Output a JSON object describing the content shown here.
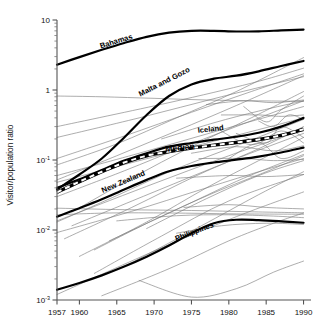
{
  "chart_data": {
    "type": "line",
    "title": "",
    "xlabel": "",
    "ylabel": "Visitor/population ratio",
    "xlim": [
      1957,
      1991
    ],
    "ylim": [
      0.001,
      10
    ],
    "yscale": "log",
    "grid": false,
    "legend": "none",
    "xticks": [
      "1957",
      "1960",
      "1965",
      "1970",
      "1975",
      "1980",
      "1985",
      "1990"
    ],
    "xtick_values": [
      1957,
      1960,
      1965,
      1970,
      1975,
      1980,
      1985,
      1990
    ],
    "yticks": [
      "10",
      "1",
      "10",
      "10",
      "10"
    ],
    "ytick_exponents": [
      "",
      "",
      "-1",
      "-2",
      "-3"
    ],
    "ytick_values": [
      10,
      1,
      0.1,
      0.01,
      0.001
    ],
    "annotations": [
      {
        "text": "Bahamas",
        "x": 1965.0,
        "y": 4.6,
        "rotation": -17
      },
      {
        "text": "Malta and Gozo",
        "x": 1971.5,
        "y": 1.22,
        "rotation": -27
      },
      {
        "text": "Iceland",
        "x": 1977.6,
        "y": 0.255,
        "rotation": -6
      },
      {
        "text": "Median",
        "x": 1973.5,
        "y": 0.137,
        "rotation": -6
      },
      {
        "text": "New Zealand",
        "x": 1966.0,
        "y": 0.0455,
        "rotation": -23
      },
      {
        "text": "Philippines",
        "x": 1975.5,
        "y": 0.0088,
        "rotation": -21
      }
    ],
    "series": [
      {
        "name": "Bahamas",
        "style": "highlight",
        "x": [
          1957,
          1960,
          1963,
          1966,
          1969,
          1972,
          1975,
          1978,
          1981,
          1984,
          1987,
          1990
        ],
        "values": [
          2.3,
          2.95,
          3.75,
          4.7,
          5.75,
          6.6,
          7.0,
          7.0,
          6.85,
          6.9,
          7.1,
          7.3
        ]
      },
      {
        "name": "Malta and Gozo",
        "style": "highlight",
        "x": [
          1957,
          1960,
          1963,
          1966,
          1969,
          1972,
          1975,
          1978,
          1981,
          1984,
          1987,
          1990
        ],
        "values": [
          0.038,
          0.062,
          0.105,
          0.21,
          0.44,
          0.82,
          1.2,
          1.45,
          1.6,
          1.85,
          2.2,
          2.6
        ]
      },
      {
        "name": "Iceland",
        "style": "highlight",
        "x": [
          1957,
          1960,
          1963,
          1966,
          1969,
          1972,
          1975,
          1978,
          1981,
          1984,
          1987,
          1990
        ],
        "values": [
          0.04,
          0.053,
          0.072,
          0.098,
          0.125,
          0.155,
          0.175,
          0.195,
          0.215,
          0.245,
          0.3,
          0.4
        ]
      },
      {
        "name": "Median",
        "style": "median",
        "x": [
          1957,
          1960,
          1963,
          1966,
          1969,
          1972,
          1975,
          1978,
          1981,
          1984,
          1987,
          1990
        ],
        "values": [
          0.0345,
          0.049,
          0.068,
          0.092,
          0.115,
          0.132,
          0.148,
          0.163,
          0.178,
          0.196,
          0.225,
          0.275
        ]
      },
      {
        "name": "New Zealand",
        "style": "highlight",
        "x": [
          1957,
          1960,
          1963,
          1966,
          1969,
          1972,
          1975,
          1978,
          1981,
          1984,
          1987,
          1990
        ],
        "values": [
          0.0155,
          0.0205,
          0.0275,
          0.038,
          0.052,
          0.069,
          0.082,
          0.092,
          0.101,
          0.112,
          0.128,
          0.15
        ]
      },
      {
        "name": "Philippines",
        "style": "highlight",
        "x": [
          1957,
          1960,
          1963,
          1966,
          1969,
          1972,
          1975,
          1978,
          1981,
          1984,
          1987,
          1990
        ],
        "values": [
          0.0014,
          0.00175,
          0.00225,
          0.003,
          0.00415,
          0.006,
          0.009,
          0.0125,
          0.014,
          0.0138,
          0.0133,
          0.0127
        ]
      },
      {
        "name": "bg-01",
        "style": "background",
        "x": [
          1957,
          1963,
          1970,
          1977,
          1984,
          1990
        ],
        "values": [
          0.82,
          0.8,
          0.76,
          0.72,
          0.7,
          0.69
        ]
      },
      {
        "name": "bg-02",
        "style": "background",
        "x": [
          1957,
          1965,
          1973,
          1981,
          1990
        ],
        "values": [
          0.085,
          0.17,
          0.4,
          0.95,
          2.9
        ]
      },
      {
        "name": "bg-03",
        "style": "background",
        "x": [
          1957,
          1965,
          1973,
          1981,
          1990
        ],
        "values": [
          0.052,
          0.115,
          0.26,
          0.6,
          1.6
        ]
      },
      {
        "name": "bg-04",
        "style": "background",
        "x": [
          1957,
          1966,
          1975,
          1983,
          1990
        ],
        "values": [
          0.105,
          0.22,
          0.48,
          0.95,
          1.7
        ]
      },
      {
        "name": "bg-05",
        "style": "background",
        "x": [
          1959,
          1967,
          1975,
          1983,
          1990
        ],
        "values": [
          0.018,
          0.055,
          0.155,
          0.4,
          0.95
        ]
      },
      {
        "name": "bg-06",
        "style": "background",
        "x": [
          1957,
          1966,
          1974,
          1982,
          1990
        ],
        "values": [
          0.03,
          0.07,
          0.155,
          0.33,
          0.7
        ]
      },
      {
        "name": "bg-07",
        "style": "background",
        "x": [
          1957,
          1965,
          1973,
          1982,
          1990
        ],
        "values": [
          0.013,
          0.031,
          0.075,
          0.175,
          0.38
        ]
      },
      {
        "name": "bg-08",
        "style": "background",
        "x": [
          1958,
          1967,
          1976,
          1984,
          1990
        ],
        "values": [
          0.0075,
          0.021,
          0.062,
          0.145,
          0.3
        ]
      },
      {
        "name": "bg-09",
        "style": "background",
        "x": [
          1960,
          1969,
          1977,
          1984,
          1990
        ],
        "values": [
          0.0042,
          0.013,
          0.04,
          0.098,
          0.21
        ]
      },
      {
        "name": "bg-10",
        "style": "background",
        "x": [
          1957,
          1966,
          1975,
          1983,
          1990
        ],
        "values": [
          0.0205,
          0.0195,
          0.019,
          0.0182,
          0.0176
        ]
      },
      {
        "name": "bg-11",
        "style": "background",
        "x": [
          1962,
          1970,
          1978,
          1985,
          1990
        ],
        "values": [
          0.0052,
          0.014,
          0.034,
          0.068,
          0.115
        ]
      },
      {
        "name": "bg-12",
        "style": "background",
        "x": [
          1957,
          1967,
          1976,
          1984,
          1990
        ],
        "values": [
          0.0092,
          0.0185,
          0.037,
          0.068,
          0.105
        ]
      },
      {
        "name": "bg-13",
        "style": "background",
        "x": [
          1965,
          1973,
          1980,
          1986,
          1990
        ],
        "values": [
          0.0135,
          0.016,
          0.0165,
          0.0158,
          0.015
        ]
      },
      {
        "name": "bg-14",
        "style": "background",
        "x": [
          1968,
          1975,
          1981,
          1986,
          1990
        ],
        "values": [
          0.0019,
          0.0011,
          0.00145,
          0.0025,
          0.0036
        ]
      },
      {
        "name": "bg-15",
        "style": "background",
        "x": [
          1963,
          1972,
          1980,
          1986,
          1990
        ],
        "values": [
          0.00115,
          0.0028,
          0.007,
          0.0125,
          0.0175
        ]
      },
      {
        "name": "bg-16",
        "style": "background",
        "x": [
          1971,
          1978,
          1984,
          1990
        ],
        "values": [
          0.2,
          0.34,
          0.5,
          0.7
        ]
      },
      {
        "name": "bg-17",
        "style": "background",
        "x": [
          1973,
          1980,
          1985,
          1990
        ],
        "values": [
          0.055,
          0.06,
          0.058,
          0.062
        ]
      },
      {
        "name": "bg-18",
        "style": "background",
        "x": [
          1974,
          1980,
          1985,
          1990
        ],
        "values": [
          0.021,
          0.023,
          0.021,
          0.02
        ]
      },
      {
        "name": "bg-19",
        "style": "background",
        "x": [
          1976,
          1982,
          1986,
          1990
        ],
        "values": [
          0.105,
          0.105,
          0.098,
          0.102
        ]
      },
      {
        "name": "bg-20",
        "style": "background",
        "x": [
          1978,
          1983,
          1987,
          1990
        ],
        "values": [
          0.3,
          0.165,
          0.26,
          0.175
        ]
      },
      {
        "name": "bg-21",
        "style": "background",
        "x": [
          1979,
          1984,
          1987,
          1990
        ],
        "values": [
          0.44,
          0.44,
          0.42,
          0.44
        ]
      },
      {
        "name": "bg-22",
        "style": "background",
        "x": [
          1980,
          1984,
          1987,
          1990
        ],
        "values": [
          0.105,
          0.175,
          0.105,
          0.135
        ]
      },
      {
        "name": "bg-23",
        "style": "background",
        "x": [
          1957,
          1968,
          1979,
          1990
        ],
        "values": [
          0.21,
          0.4,
          0.8,
          1.55
        ]
      },
      {
        "name": "bg-24",
        "style": "background",
        "x": [
          1957,
          1968,
          1979,
          1990
        ],
        "values": [
          0.06,
          0.125,
          0.27,
          0.58
        ]
      },
      {
        "name": "bg-25",
        "style": "background",
        "x": [
          1959,
          1970,
          1980,
          1990
        ],
        "values": [
          0.0115,
          0.035,
          0.095,
          0.24
        ]
      },
      {
        "name": "bg-26",
        "style": "background",
        "x": [
          1964,
          1974,
          1982,
          1990
        ],
        "values": [
          0.007,
          0.022,
          0.055,
          0.12
        ]
      },
      {
        "name": "bg-27",
        "style": "background",
        "x": [
          1957,
          1969,
          1980,
          1990
        ],
        "values": [
          0.0135,
          0.042,
          0.115,
          0.27
        ]
      },
      {
        "name": "bg-28",
        "style": "background",
        "x": [
          1969,
          1977,
          1984,
          1990
        ],
        "values": [
          0.0105,
          0.028,
          0.06,
          0.098
        ]
      },
      {
        "name": "bg-29",
        "style": "background",
        "x": [
          1957,
          1970,
          1981,
          1990
        ],
        "values": [
          0.0012,
          0.005,
          0.0155,
          0.035
        ]
      },
      {
        "name": "bg-30",
        "style": "background",
        "x": [
          1975,
          1981,
          1986,
          1990
        ],
        "values": [
          0.125,
          0.155,
          0.135,
          0.16
        ]
      },
      {
        "name": "bg-31",
        "style": "background",
        "x": [
          1977,
          1982,
          1986,
          1990
        ],
        "values": [
          0.62,
          0.7,
          0.66,
          0.72
        ]
      },
      {
        "name": "bg-32",
        "style": "background",
        "x": [
          1982,
          1985,
          1987,
          1990
        ],
        "values": [
          0.58,
          0.35,
          0.52,
          0.82
        ]
      },
      {
        "name": "bg-33",
        "style": "background",
        "x": [
          1957,
          1972,
          1983,
          1990
        ],
        "values": [
          0.3,
          0.66,
          1.25,
          2.05
        ]
      },
      {
        "name": "bg-34",
        "style": "background",
        "x": [
          1966,
          1976,
          1984,
          1990
        ],
        "values": [
          0.003,
          0.011,
          0.032,
          0.068
        ]
      },
      {
        "name": "bg-35",
        "style": "background",
        "x": [
          1981,
          1985,
          1987,
          1990
        ],
        "values": [
          0.24,
          0.175,
          0.3,
          0.21
        ]
      },
      {
        "name": "bg-36",
        "style": "background",
        "x": [
          1984,
          1986,
          1988,
          1990
        ],
        "values": [
          0.36,
          0.3,
          0.44,
          0.38
        ]
      },
      {
        "name": "bg-37",
        "style": "background",
        "x": [
          1973,
          1979,
          1985,
          1990
        ],
        "values": [
          0.009,
          0.0115,
          0.0125,
          0.012
        ]
      },
      {
        "name": "bg-38",
        "style": "background",
        "x": [
          1957,
          1964,
          1972,
          1981,
          1990
        ],
        "values": [
          0.0165,
          0.0175,
          0.0175,
          0.017,
          0.0168
        ]
      },
      {
        "name": "bg-39",
        "style": "background",
        "x": [
          1962,
          1971,
          1980,
          1990
        ],
        "values": [
          0.0024,
          0.0082,
          0.026,
          0.062
        ]
      },
      {
        "name": "bg-40",
        "style": "background",
        "x": [
          1957,
          1973,
          1985,
          1990
        ],
        "values": [
          0.048,
          0.135,
          0.29,
          0.4
        ]
      }
    ]
  }
}
